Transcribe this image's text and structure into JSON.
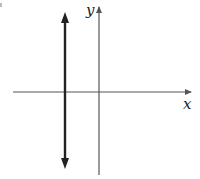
{
  "diagram": {
    "axes": {
      "x_label": "x",
      "y_label": "y"
    },
    "line": {
      "type": "vertical",
      "position": "negative x",
      "arrows": "both-ends"
    },
    "colors": {
      "axis": "#555555",
      "line": "#222222",
      "background": "#ffffff"
    }
  }
}
